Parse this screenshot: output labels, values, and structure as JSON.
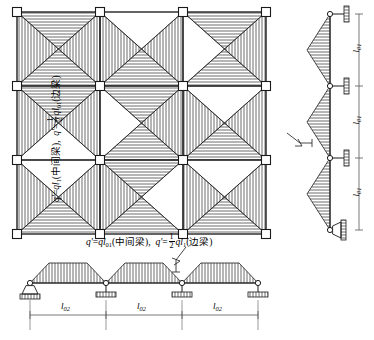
{
  "figure": {
    "type": "structural-load-distribution-diagram"
  },
  "captions": {
    "horizontal": {
      "part1_q": "q'",
      "part1_eq": "=",
      "part1_expr": "ql",
      "part1_sub": "01",
      "part1_note": "(中间梁)",
      "separator": ",",
      "part2_q": "q'",
      "part2_eq": "=",
      "part2_frac_num": "1",
      "part2_frac_den": "2",
      "part2_expr": "ql",
      "part2_sub": "1",
      "part2_note": "(边梁)"
    },
    "vertical": {
      "part1_q": "q'",
      "part1_eq": "=",
      "part1_expr": "ql",
      "part1_sub": "1",
      "part1_note": "(中间梁)",
      "separator": ",",
      "part2_q": "q'",
      "part2_eq": "=",
      "part2_frac_num": "1",
      "part2_frac_den": "2",
      "part2_expr": "ql",
      "part2_sub": "01",
      "part2_note": "(边梁)"
    }
  },
  "plan": {
    "grid_columns": 4,
    "grid_rows": 4,
    "panels_x": 3,
    "panels_y": 3,
    "node_marker": "open-square-column",
    "hatch_vertical_label": "vertical-hatch",
    "hatch_horizontal_label": "horizontal-hatch"
  },
  "right_elevation": {
    "spans": 3,
    "span_label": "l",
    "span_sub": "01",
    "dimensions": [
      "l01",
      "l01",
      "l01"
    ],
    "load_shape": "triangular",
    "supports": [
      "roller",
      "roller",
      "roller",
      "pin"
    ]
  },
  "bottom_elevation": {
    "spans": 3,
    "span_label": "l",
    "span_sub": "02",
    "dimensions": [
      "l02",
      "l02",
      "l02"
    ],
    "load_shape": "trapezoidal",
    "supports": [
      "pin",
      "roller",
      "roller",
      "roller"
    ]
  },
  "colors": {
    "line": "#1a1a1a",
    "hatch": "#3a3a3a",
    "dimension": "#555555",
    "background": "#ffffff"
  }
}
